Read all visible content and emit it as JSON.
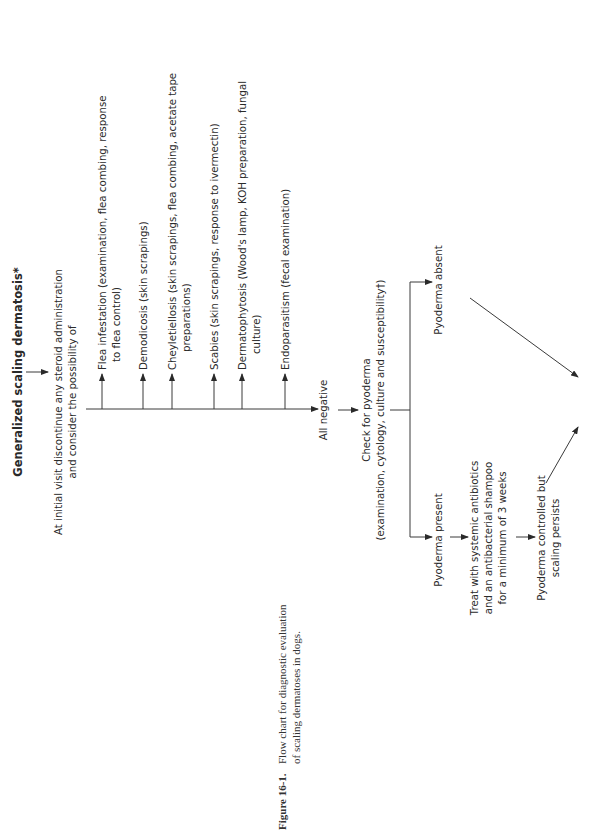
{
  "figure": {
    "label": "Figure 16-1.",
    "caption_line1": "Flow chart for diagnostic evaluation",
    "caption_line2": "of scaling dermatoses in dogs."
  },
  "flowchart": {
    "orientation": "rotated 90° counter-clockwise",
    "start": "Generalized scaling dermatosis*",
    "initial_step": {
      "line1": "At initial visit discontinue any steroid administration",
      "line2": "and consider the possibility of"
    },
    "possibilities": [
      {
        "line1": "Flea infestation (examination, flea combing, response",
        "line2": "to flea control)"
      },
      {
        "line1": "Demodicosis (skin scrapings)",
        "line2": ""
      },
      {
        "line1": "Cheyletiellosis (skin scrapings, flea combing, acetate tape",
        "line2": "preparations)"
      },
      {
        "line1": "Scabies (skin scrapings, response to ivermectin)",
        "line2": ""
      },
      {
        "line1": "Dermatophytosis (Wood's lamp, KOH preparation, fungal",
        "line2": "culture)"
      },
      {
        "line1": "Endoparasitism (fecal examination)",
        "line2": ""
      }
    ],
    "all_negative": "All negative",
    "check_pyoderma": {
      "line1": "Check for pyoderma",
      "line2": "(examination, cytology, culture and susceptibility†)"
    },
    "pyoderma_absent": "Pyoderma absent",
    "pyoderma_present": "Pyoderma present",
    "treat": {
      "line1": "Treat with systemic antibiotics",
      "line2": "and an antibacterial shampoo",
      "line3": "for a minimum of 3 weeks"
    },
    "controlled": {
      "line1": "Pyoderma controlled but",
      "line2": "scaling persists"
    }
  }
}
